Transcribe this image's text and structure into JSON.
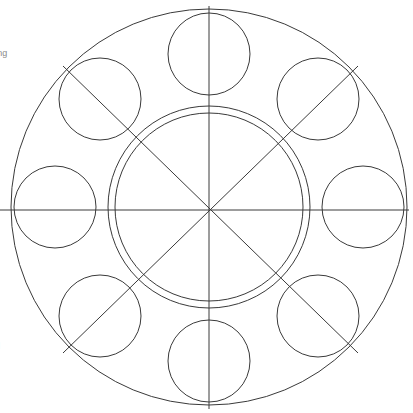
{
  "page": {
    "background_color": "#ffffff",
    "width": 413,
    "height": 413
  },
  "figure": {
    "name": "eight-petal-rosette",
    "stroke_color": "#3a3a3a",
    "stroke_width": 1,
    "fill": "none",
    "center": {
      "x": 209,
      "y": 207
    },
    "outer_circle": {
      "label": "outer boundary circle",
      "cx": 209,
      "cy": 207,
      "r": 198
    },
    "inner_circles": [
      {
        "label": "inner circle outer ring",
        "cx": 209,
        "cy": 207,
        "r": 101
      },
      {
        "label": "inner circle inner ring",
        "cx": 209,
        "cy": 207,
        "r": 94
      }
    ],
    "petal_circles": [
      {
        "label": "petal-n",
        "angle_deg": 270,
        "cx": 209,
        "cy": 54,
        "r": 41
      },
      {
        "label": "petal-ne",
        "angle_deg": 315,
        "cx": 318,
        "cy": 99,
        "r": 41
      },
      {
        "label": "petal-e",
        "angle_deg": 0,
        "cx": 363,
        "cy": 207,
        "r": 41
      },
      {
        "label": "petal-se",
        "angle_deg": 45,
        "cx": 318,
        "cy": 316,
        "r": 41
      },
      {
        "label": "petal-s",
        "angle_deg": 90,
        "cx": 209,
        "cy": 361,
        "r": 41
      },
      {
        "label": "petal-sw",
        "angle_deg": 135,
        "cx": 100,
        "cy": 316,
        "r": 41
      },
      {
        "label": "petal-w",
        "angle_deg": 180,
        "cx": 55,
        "cy": 207,
        "r": 41
      },
      {
        "label": "petal-nw",
        "angle_deg": 225,
        "cx": 100,
        "cy": 99,
        "r": 41
      }
    ],
    "diameter_lines": [
      {
        "label": "vertical-diameter",
        "angle_deg": 90,
        "x1": 209,
        "y1": 6,
        "x2": 209,
        "y2": 409
      },
      {
        "label": "horizontal-diameter",
        "angle_deg": 0,
        "x1": 0,
        "y1": 210,
        "x2": 409,
        "y2": 210
      },
      {
        "label": "diagonal-diameter-nw-se",
        "angle_deg": 45,
        "x1": 63,
        "y1": 66,
        "x2": 358,
        "y2": 353
      },
      {
        "label": "diagonal-diameter-ne-sw",
        "angle_deg": 135,
        "x1": 358,
        "y1": 66,
        "x2": 63,
        "y2": 353
      }
    ]
  },
  "margin_notes": {
    "fragment_1": "n",
    "fragment_2": "ning",
    "fragment_3": "e",
    "fragment_4": "d"
  }
}
